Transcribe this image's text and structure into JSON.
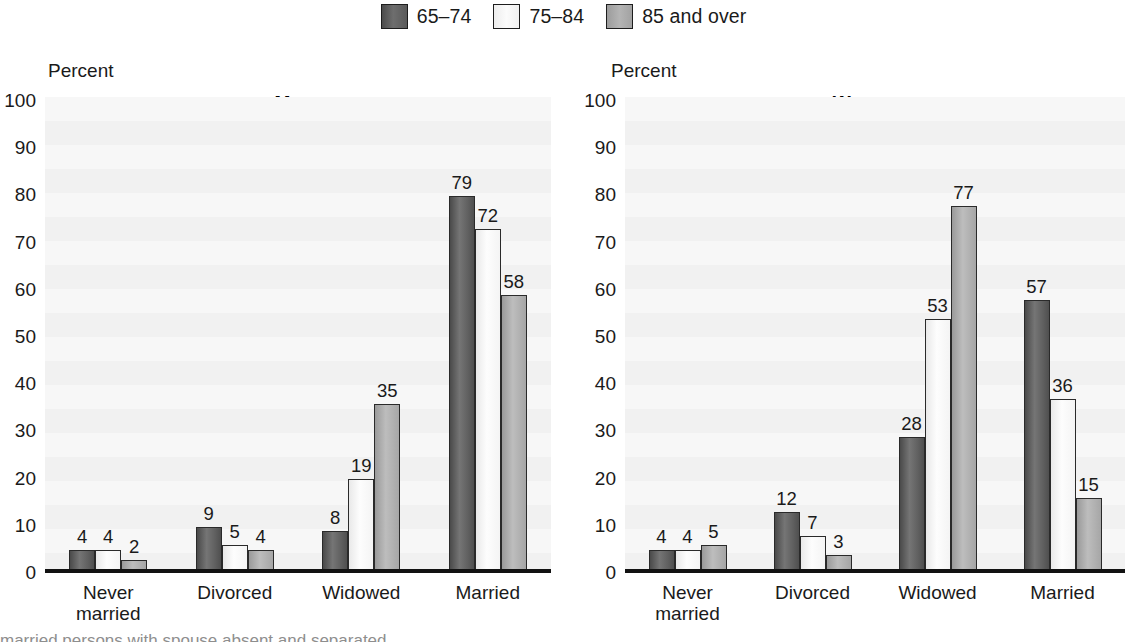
{
  "legend": {
    "items": [
      {
        "label": "65–74",
        "swatch": "swatch-dark",
        "color": "#5a5a5a"
      },
      {
        "label": "75–84",
        "swatch": "swatch-light",
        "color": "#f5f5f5"
      },
      {
        "label": "85 and over",
        "swatch": "swatch-mid",
        "color": "#a8a8a8"
      }
    ]
  },
  "footnote": "married persons with spouse absent and separated",
  "panels": [
    {
      "id": "men",
      "title": "Men",
      "axis_title": "Percent"
    },
    {
      "id": "women",
      "title": "Women",
      "axis_title": "Percent"
    }
  ],
  "yticks": [
    "100",
    "90",
    "80",
    "70",
    "60",
    "50",
    "40",
    "30",
    "20",
    "10",
    "0"
  ],
  "categories": [
    {
      "line1": "Never",
      "line2": "married"
    },
    {
      "line1": "Divorced",
      "line2": ""
    },
    {
      "line1": "Widowed",
      "line2": ""
    },
    {
      "line1": "Married",
      "line2": ""
    }
  ],
  "chart_data": [
    {
      "type": "bar",
      "title": "Men",
      "xlabel": "",
      "ylabel": "Percent",
      "ylim": [
        0,
        100
      ],
      "ytick_step": 10,
      "grid": true,
      "legend_position": "top-center",
      "categories": [
        "Never married",
        "Divorced",
        "Widowed",
        "Married"
      ],
      "series": [
        {
          "name": "65–74",
          "values": [
            4,
            9,
            8,
            79
          ]
        },
        {
          "name": "75–84",
          "values": [
            4,
            5,
            19,
            72
          ]
        },
        {
          "name": "85 and over",
          "values": [
            2,
            4,
            35,
            58
          ]
        }
      ]
    },
    {
      "type": "bar",
      "title": "Women",
      "xlabel": "",
      "ylabel": "Percent",
      "ylim": [
        0,
        100
      ],
      "ytick_step": 10,
      "grid": true,
      "legend_position": "top-center",
      "categories": [
        "Never married",
        "Divorced",
        "Widowed",
        "Married"
      ],
      "series": [
        {
          "name": "65–74",
          "values": [
            4,
            12,
            28,
            57
          ]
        },
        {
          "name": "75–84",
          "values": [
            4,
            7,
            53,
            36
          ]
        },
        {
          "name": "85 and over",
          "values": [
            5,
            3,
            77,
            15
          ]
        }
      ]
    }
  ]
}
